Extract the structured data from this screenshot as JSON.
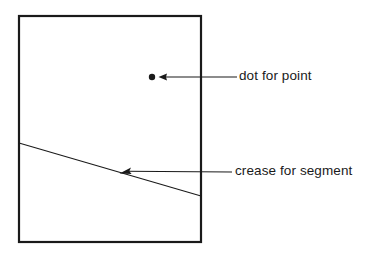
{
  "figure": {
    "background_color": "#ffffff",
    "ink_color": "#1a1a1a",
    "width": 386,
    "height": 256
  },
  "paper": {
    "name": "paper-sheet",
    "shape": "rectangle",
    "x": 19,
    "y": 16,
    "width": 182,
    "height": 226,
    "stroke_width": 2.2,
    "stroke_color": "#1a1a1a",
    "fill": "none"
  },
  "dot": {
    "name": "point-dot",
    "cx": 152,
    "cy": 77,
    "r": 3.2,
    "fill": "#1a1a1a"
  },
  "crease": {
    "name": "crease-line",
    "x1": 19,
    "y1": 143,
    "x2": 201,
    "y2": 196,
    "stroke_width": 1.1,
    "stroke_color": "#1a1a1a"
  },
  "annotations": [
    {
      "id": "dot-for-point",
      "label": "dot for point",
      "leader": {
        "x1": 237,
        "y1": 77,
        "x2": 161,
        "y2": 77
      },
      "arrow_tip": {
        "x": 158,
        "y": 77
      },
      "label_position": {
        "left": 239,
        "top": 69
      }
    },
    {
      "id": "crease-for-segment",
      "label": "crease for segment",
      "leader": {
        "x1": 232,
        "y1": 172,
        "x2": 124,
        "y2": 172
      },
      "arrow_tip": {
        "x": 119,
        "y": 173
      },
      "label_position": {
        "left": 235,
        "top": 164
      }
    }
  ]
}
